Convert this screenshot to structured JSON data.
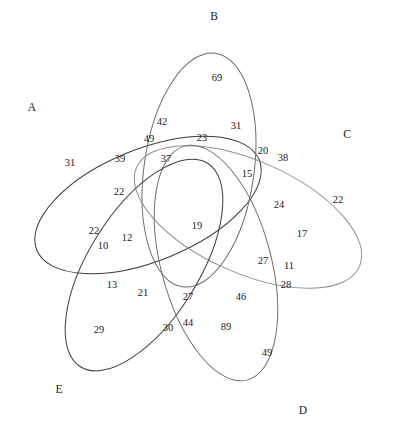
{
  "figure": {
    "type": "venn-diagram",
    "sets": 5,
    "width": 398,
    "height": 428,
    "background_color": "#ffffff"
  },
  "chart_data": {
    "type": "venn",
    "title": "",
    "set_count": 5,
    "set_labels": [
      "A",
      "B",
      "C",
      "D",
      "E"
    ],
    "regions": [
      {
        "label": "31",
        "value": 31,
        "x": 70,
        "y": 163
      },
      {
        "label": "69",
        "value": 69,
        "x": 217,
        "y": 78
      },
      {
        "label": "22",
        "value": 22,
        "x": 338,
        "y": 200
      },
      {
        "label": "29",
        "value": 29,
        "x": 99,
        "y": 330
      },
      {
        "label": "49",
        "value": 49,
        "x": 267,
        "y": 353
      },
      {
        "label": "42",
        "value": 42,
        "x": 162,
        "y": 122
      },
      {
        "label": "49",
        "value": 49,
        "x": 149,
        "y": 139
      },
      {
        "label": "23",
        "value": 23,
        "x": 202,
        "y": 138
      },
      {
        "label": "31",
        "value": 31,
        "x": 236,
        "y": 126
      },
      {
        "label": "20",
        "value": 20,
        "x": 263,
        "y": 151
      },
      {
        "label": "38",
        "value": 38,
        "x": 283,
        "y": 158
      },
      {
        "label": "39",
        "value": 39,
        "x": 120,
        "y": 159
      },
      {
        "label": "37",
        "value": 37,
        "x": 166,
        "y": 159
      },
      {
        "label": "15",
        "value": 15,
        "x": 247,
        "y": 174
      },
      {
        "label": "22",
        "value": 22,
        "x": 119,
        "y": 192
      },
      {
        "label": "24",
        "value": 24,
        "x": 279,
        "y": 205
      },
      {
        "label": "19",
        "value": 19,
        "x": 197,
        "y": 226
      },
      {
        "label": "17",
        "value": 17,
        "x": 302,
        "y": 234
      },
      {
        "label": "22",
        "value": 22,
        "x": 94,
        "y": 231
      },
      {
        "label": "12",
        "value": 12,
        "x": 127,
        "y": 238
      },
      {
        "label": "10",
        "value": 10,
        "x": 103,
        "y": 246
      },
      {
        "label": "27",
        "value": 27,
        "x": 263,
        "y": 261
      },
      {
        "label": "11",
        "value": 11,
        "x": 289,
        "y": 266
      },
      {
        "label": "13",
        "value": 13,
        "x": 112,
        "y": 285
      },
      {
        "label": "21",
        "value": 21,
        "x": 143,
        "y": 293
      },
      {
        "label": "27",
        "value": 27,
        "x": 188,
        "y": 297
      },
      {
        "label": "46",
        "value": 46,
        "x": 241,
        "y": 297
      },
      {
        "label": "28",
        "value": 28,
        "x": 286,
        "y": 285
      },
      {
        "label": "30",
        "value": 30,
        "x": 168,
        "y": 328
      },
      {
        "label": "44",
        "value": 44,
        "x": 188,
        "y": 323
      },
      {
        "label": "89",
        "value": 89,
        "x": 226,
        "y": 327
      }
    ],
    "set_label_positions": [
      {
        "label": "A",
        "x": 32,
        "y": 108
      },
      {
        "label": "B",
        "x": 214,
        "y": 17
      },
      {
        "label": "C",
        "x": 347,
        "y": 135
      },
      {
        "label": "D",
        "x": 303,
        "y": 411
      },
      {
        "label": "E",
        "x": 59,
        "y": 390
      }
    ]
  },
  "ellipses": [
    {
      "name": "A",
      "cx": 148,
      "cy": 205,
      "rx": 120,
      "ry": 56,
      "rotate": -22,
      "stroke": "#3a3a3a"
    },
    {
      "name": "B",
      "cx": 199,
      "cy": 170,
      "rx": 118,
      "ry": 55,
      "rotate": -82,
      "stroke": "#6e6e6e"
    },
    {
      "name": "C",
      "cx": 248,
      "cy": 217,
      "rx": 122,
      "ry": 56,
      "rotate": 24,
      "stroke": "#8f8f8f"
    },
    {
      "name": "D",
      "cx": 216,
      "cy": 263,
      "rx": 121,
      "ry": 55,
      "rotate": 75,
      "stroke": "#707070"
    },
    {
      "name": "E",
      "cx": 144,
      "cy": 265,
      "rx": 120,
      "ry": 55,
      "rotate": -58,
      "stroke": "#3f3f3f"
    }
  ]
}
